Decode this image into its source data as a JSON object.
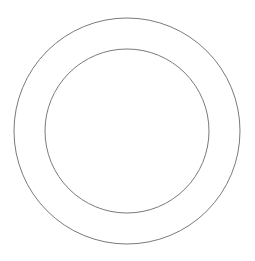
{
  "diagram": {
    "type": "concentric-circles",
    "background": "#ffffff",
    "stroke_color": "#7a7a7a",
    "stroke_width": 1,
    "center": {
      "x": 127,
      "y": 131
    },
    "circles": [
      {
        "name": "outer-circle",
        "radius": 113
      },
      {
        "name": "inner-circle",
        "radius": 82
      }
    ]
  }
}
